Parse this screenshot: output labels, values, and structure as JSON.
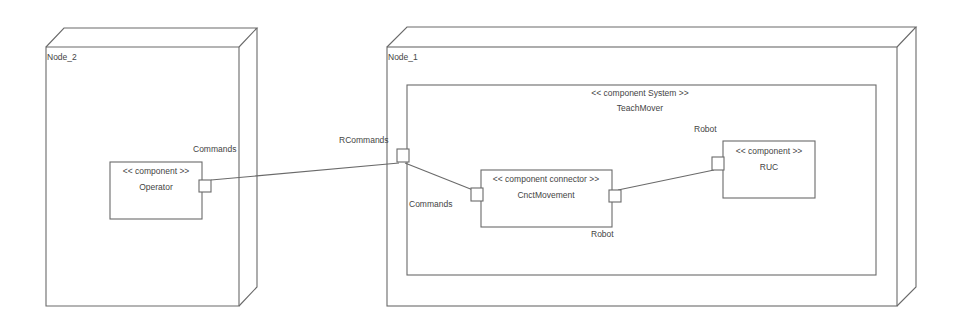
{
  "diagram": {
    "type": "UML deployment diagram",
    "colors": {
      "line": "#6a6a6a",
      "text": "#444444",
      "background": "#ffffff"
    },
    "nodes": [
      {
        "id": "node2",
        "label": "Node_2"
      },
      {
        "id": "node1",
        "label": "Node_1"
      }
    ],
    "system": {
      "stereotype": "<< component System >>",
      "name": "TeachMover"
    },
    "components": [
      {
        "id": "operator",
        "stereotype": "<< component >>",
        "name": "Operator"
      },
      {
        "id": "cnct",
        "stereotype": "<< component connector >>",
        "name": "CnctMovement"
      },
      {
        "id": "ruc",
        "stereotype": "<< component >>",
        "name": "RUC"
      }
    ],
    "ports": {
      "operator_commands": "Commands",
      "system_rcommands": "RCommands",
      "cnct_commands": "Commands",
      "cnct_robot": "Robot",
      "ruc_robot": "Robot"
    }
  }
}
